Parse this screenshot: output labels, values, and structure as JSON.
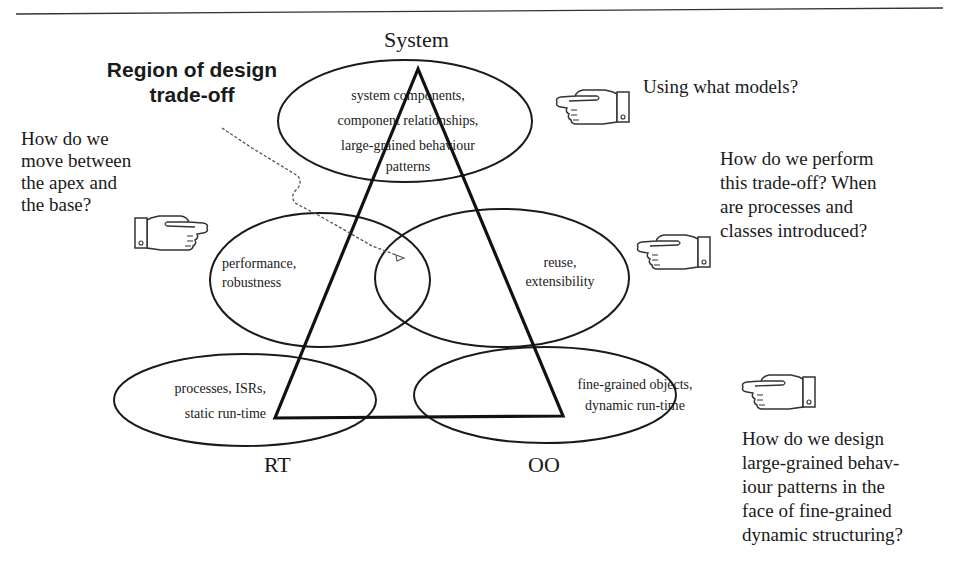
{
  "figure": {
    "title_callout": [
      "Region of design",
      "trade-off"
    ],
    "apex_label": "System",
    "base_left_label": "RT",
    "base_right_label": "OO"
  },
  "regions": {
    "top": [
      "system components,",
      "component relationships,",
      "large-grained behaviour",
      "patterns"
    ],
    "middle_left": [
      "performance,",
      "robustness"
    ],
    "middle_right": [
      "reuse,",
      "extensibility"
    ],
    "bottom_left": [
      "processes, ISRs,",
      "static run-time"
    ],
    "bottom_right": [
      "fine-grained objects,",
      "dynamic run-time"
    ]
  },
  "questions": {
    "models": "Using what models?",
    "apex_base": [
      "How do we",
      "move between",
      "the apex and",
      "the base?"
    ],
    "trade_off": [
      "How do we perform",
      "this trade-off? When",
      "are processes and",
      "classes introduced?"
    ],
    "design": [
      "How do we design",
      "large-grained behav-",
      "iour patterns in the",
      "face of fine-grained",
      "dynamic structuring?"
    ]
  },
  "icons": {
    "pointing_hand_left": "pointing-hand-left-icon",
    "pointing_hand_right": "pointing-hand-right-icon"
  },
  "colors": {
    "ink": "#1a1a1a",
    "dashed_arrow": "#555555",
    "background": "#ffffff"
  }
}
